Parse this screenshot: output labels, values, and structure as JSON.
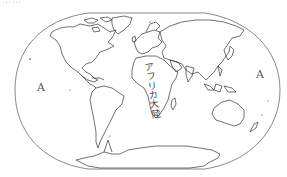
{
  "map": {
    "title_cut_off": "……",
    "projection_style": "world outline map (Winkel tripel-like)",
    "labels": {
      "ocean_left": "A",
      "ocean_right": "A",
      "continent": "アフリカ大陸"
    },
    "colors": {
      "background": "#ffffff",
      "frame_stroke": "#6a6a6a",
      "coastline": "#333333",
      "label_text": "#555555"
    }
  }
}
